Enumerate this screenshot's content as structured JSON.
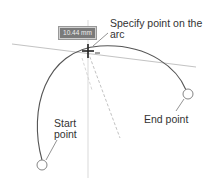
{
  "tooltip": {
    "value": "10.44 mm"
  },
  "labels": {
    "prompt": "Specify point on the arc",
    "prompt_line1": "Specify point on the",
    "prompt_line2": "arc",
    "start_line1": "Start",
    "start_line2": "point",
    "end": "End point"
  },
  "colors": {
    "arc": "#555555",
    "guide": "#bbbbbb",
    "text": "#333333"
  }
}
